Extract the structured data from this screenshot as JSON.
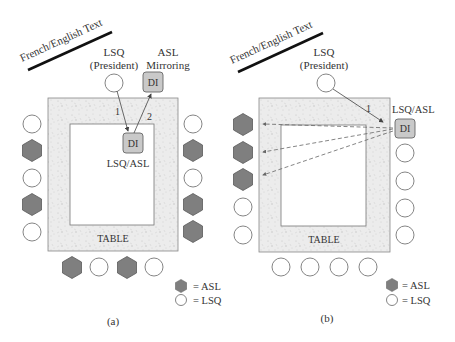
{
  "colors": {
    "asl_fill": "#7f7f7f",
    "asl_stroke": "#5a5a5a",
    "lsq_fill": "#ffffff",
    "lsq_stroke": "#777777",
    "table_fill": "#ebebeb",
    "di_fill": "#c9c9c9",
    "line": "#555555"
  },
  "panels": [
    {
      "id": "a",
      "caption": "(a)",
      "banner": "French/English Text",
      "president_label_line1": "LSQ",
      "president_label_line2": "(President)",
      "mirroring_label_line1": "ASL",
      "mirroring_label_line2": "Mirroring",
      "di_mirror_label": "DI",
      "di_center_label": "DI",
      "di_center_caption": "LSQ/ASL",
      "arrow_1_label": "1",
      "arrow_2_label": "2",
      "table_label": "TABLE",
      "left_seats": [
        "LSQ",
        "ASL",
        "LSQ",
        "ASL",
        "LSQ"
      ],
      "right_seats": [
        "LSQ",
        "ASL",
        "LSQ",
        "ASL",
        "ASL"
      ],
      "bottom_seats": [
        "ASL",
        "LSQ",
        "ASL",
        "LSQ"
      ],
      "legend": [
        {
          "shape": "hexagon",
          "label": "= ASL"
        },
        {
          "shape": "circle",
          "label": "= LSQ"
        }
      ]
    },
    {
      "id": "b",
      "caption": "(b)",
      "banner": "French/English Text",
      "president_label_line1": "LSQ",
      "president_label_line2": "(President)",
      "di_label": "DI",
      "di_caption": "LSQ/ASL",
      "arrow_1_label": "1",
      "table_label": "TABLE",
      "left_seats": [
        "ASL",
        "ASL",
        "ASL",
        "LSQ",
        "LSQ"
      ],
      "right_seats": [
        "LSQ",
        "LSQ",
        "LSQ",
        "LSQ"
      ],
      "bottom_seats": [
        "LSQ",
        "LSQ",
        "LSQ",
        "LSQ"
      ],
      "legend": [
        {
          "shape": "hexagon",
          "label": "= ASL"
        },
        {
          "shape": "circle",
          "label": "= LSQ"
        }
      ]
    }
  ]
}
